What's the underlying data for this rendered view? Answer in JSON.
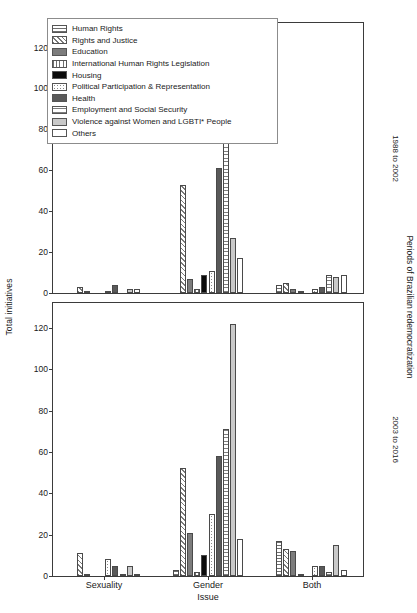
{
  "chart_data": {
    "type": "bar",
    "title": "",
    "xlabel": "Issue",
    "ylabel": "Total initiatives",
    "right_axis_label": "Periods of Brazilian redemocratization",
    "categories": [
      "Sexuality",
      "Gender",
      "Both"
    ],
    "yticks_top": [
      0,
      20,
      40,
      60,
      80,
      100,
      120
    ],
    "yticks_bottom": [
      0,
      20,
      40,
      60,
      80,
      100,
      120
    ],
    "ylim": [
      0,
      132
    ],
    "grid": false,
    "legend_position": "top-left",
    "panels": [
      {
        "strip_label": "1988 to 2002",
        "series": [
          {
            "name": "Human Rights",
            "pattern": "p-human-rights",
            "values": [
              0,
              0,
              4
            ]
          },
          {
            "name": "Rights and Justice",
            "pattern": "p-rights-justice",
            "values": [
              3,
              53,
              5
            ]
          },
          {
            "name": "Education",
            "pattern": "p-education",
            "values": [
              1,
              7,
              2
            ]
          },
          {
            "name": "International Human Rights Legislation",
            "pattern": "p-intl-legislation",
            "values": [
              0,
              2,
              1
            ]
          },
          {
            "name": "Housing",
            "pattern": "p-housing",
            "values": [
              0,
              9,
              0
            ]
          },
          {
            "name": "Political Participation & Representation",
            "pattern": "p-political",
            "values": [
              1,
              11,
              2
            ]
          },
          {
            "name": "Health",
            "pattern": "p-health",
            "values": [
              4,
              61,
              3
            ]
          },
          {
            "name": "Employment and Social Security",
            "pattern": "p-employment",
            "values": [
              0,
              84,
              9
            ]
          },
          {
            "name": "Violence against Women and LGBTI* People",
            "pattern": "p-violence",
            "values": [
              2,
              27,
              8
            ]
          },
          {
            "name": "Others",
            "pattern": "p-others",
            "values": [
              2,
              17,
              9
            ]
          }
        ]
      },
      {
        "strip_label": "2003 to 2016",
        "series": [
          {
            "name": "Human Rights",
            "pattern": "p-human-rights",
            "values": [
              0,
              3,
              17
            ]
          },
          {
            "name": "Rights and Justice",
            "pattern": "p-rights-justice",
            "values": [
              11,
              52,
              13
            ]
          },
          {
            "name": "Education",
            "pattern": "p-education",
            "values": [
              1,
              21,
              12
            ]
          },
          {
            "name": "International Human Rights Legislation",
            "pattern": "p-intl-legislation",
            "values": [
              0,
              2,
              1
            ]
          },
          {
            "name": "Housing",
            "pattern": "p-housing",
            "values": [
              0,
              10,
              0
            ]
          },
          {
            "name": "Political Participation & Representation",
            "pattern": "p-political",
            "values": [
              8,
              30,
              5
            ]
          },
          {
            "name": "Health",
            "pattern": "p-health",
            "values": [
              5,
              58,
              5
            ]
          },
          {
            "name": "Employment and Social Security",
            "pattern": "p-employment",
            "values": [
              1,
              71,
              2
            ]
          },
          {
            "name": "Violence against Women and LGBTI* People",
            "pattern": "p-violence",
            "values": [
              5,
              122,
              15
            ]
          },
          {
            "name": "Others",
            "pattern": "p-others",
            "values": [
              1,
              18,
              3
            ]
          }
        ]
      }
    ]
  }
}
